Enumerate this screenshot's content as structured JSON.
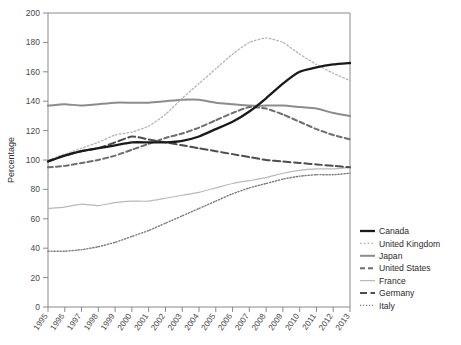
{
  "chart_data": {
    "type": "line",
    "title": "",
    "xlabel": "",
    "ylabel": "Percentage",
    "ylim": [
      0,
      200
    ],
    "ytick_step": 20,
    "yticks": [
      0,
      20,
      40,
      60,
      80,
      100,
      120,
      140,
      160,
      180,
      200
    ],
    "grid": false,
    "legend_position": "right",
    "x": [
      1995,
      1996,
      1997,
      1998,
      1999,
      2000,
      2001,
      2002,
      2003,
      2004,
      2005,
      2006,
      2007,
      2008,
      2009,
      2010,
      2011,
      2012,
      2013
    ],
    "categories": [
      "1995",
      "1996",
      "1997",
      "1998",
      "1999",
      "2000",
      "2001",
      "2002",
      "2003",
      "2004",
      "2005",
      "2006",
      "2007",
      "2008",
      "2009",
      "2010",
      "2011",
      "2012",
      "2013"
    ],
    "series": [
      {
        "name": "Canada",
        "color": "#1a1a1a",
        "style": "solid",
        "width": 2.3,
        "values": [
          99,
          103,
          106,
          108,
          110,
          112,
          112,
          112,
          113,
          116,
          121,
          126,
          133,
          142,
          152,
          160,
          163,
          165,
          166
        ]
      },
      {
        "name": "United Kingdom",
        "color": "#b4b4b4",
        "style": "dotted",
        "width": 1.3,
        "values": [
          100,
          104,
          108,
          112,
          117,
          119,
          123,
          131,
          142,
          152,
          162,
          172,
          180,
          183,
          180,
          172,
          165,
          159,
          154
        ]
      },
      {
        "name": "Japan",
        "color": "#8c8c8c",
        "style": "solid",
        "width": 2.0,
        "values": [
          137,
          138,
          137,
          138,
          139,
          139,
          139,
          140,
          141,
          141,
          139,
          138,
          137,
          137,
          137,
          136,
          135,
          132,
          130
        ]
      },
      {
        "name": "United States",
        "color": "#6e6e6e",
        "style": "dashed",
        "width": 2.0,
        "values": [
          95,
          96,
          98,
          100,
          103,
          107,
          111,
          115,
          118,
          122,
          127,
          132,
          136,
          135,
          131,
          126,
          121,
          117,
          114
        ]
      },
      {
        "name": "France",
        "color": "#b9b9b9",
        "style": "solid",
        "width": 1.2,
        "values": [
          67,
          68,
          70,
          69,
          71,
          72,
          72,
          74,
          76,
          78,
          81,
          84,
          86,
          88,
          91,
          93,
          94,
          94,
          95
        ]
      },
      {
        "name": "Germany",
        "color": "#4d4d4d",
        "style": "dashed-long",
        "width": 2.0,
        "values": [
          99,
          103,
          106,
          108,
          112,
          116,
          114,
          112,
          110,
          108,
          106,
          104,
          102,
          100,
          99,
          98,
          97,
          96,
          95
        ]
      },
      {
        "name": "Italy",
        "color": "#7a7a7a",
        "style": "fine-dotted",
        "width": 1.4,
        "values": [
          38,
          38,
          39,
          41,
          44,
          48,
          52,
          57,
          62,
          67,
          72,
          77,
          81,
          84,
          87,
          89,
          90,
          90,
          91
        ]
      }
    ]
  },
  "legend": {
    "items": [
      {
        "label": "Canada"
      },
      {
        "label": "United Kingdom"
      },
      {
        "label": "Japan"
      },
      {
        "label": "United States"
      },
      {
        "label": "France"
      },
      {
        "label": "Germany"
      },
      {
        "label": "Italy"
      }
    ]
  },
  "axes": {
    "y_axis_title": "Percentage",
    "y_tick_labels": [
      "200",
      "180",
      "160",
      "140",
      "120",
      "100",
      "80",
      "60",
      "40",
      "20",
      "0"
    ],
    "x_tick_labels": [
      "1995",
      "1996",
      "1997",
      "1998",
      "1999",
      "2000",
      "2001",
      "2002",
      "2003",
      "2004",
      "2005",
      "2006",
      "2007",
      "2008",
      "2009",
      "2010",
      "2011",
      "2012",
      "2013"
    ]
  }
}
